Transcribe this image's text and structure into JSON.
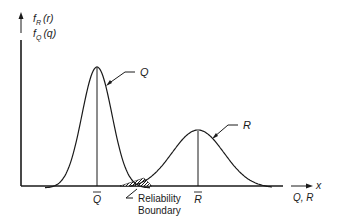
{
  "diagram": {
    "y_axis_label_top": {
      "main": "f",
      "sub": "R",
      "arg": "(r)"
    },
    "y_axis_label_bottom": {
      "main": "f",
      "sub": "Q",
      "arg": "(q)"
    },
    "x_axis_arrow_label": "x",
    "x_axis_label": "Q, R",
    "curves": [
      {
        "name": "Q",
        "label": "Q",
        "mean_label": "Q",
        "relative_mean": 0.29,
        "relative_spread": "narrow"
      },
      {
        "name": "R",
        "label": "R",
        "mean_label": "R",
        "relative_mean": 0.68,
        "relative_spread": "wide"
      }
    ],
    "overlap_annotation_line1": "Reliability",
    "overlap_annotation_line2": "Boundary",
    "colors": {
      "ink": "#1a1a1a",
      "background": "#ffffff"
    }
  }
}
